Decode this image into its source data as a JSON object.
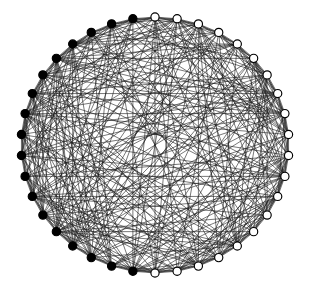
{
  "figure": {
    "background_color": "#ffffff"
  },
  "chart_data": {
    "type": "diagram",
    "subtype": "circular-graph-layout",
    "xlabel": "",
    "ylabel": "",
    "grid": false,
    "legend": "none",
    "layout": {
      "center_x": 155,
      "center_y": 145,
      "radius_x": 134,
      "radius_y": 128,
      "node_count": 38,
      "node_radius": 4.1,
      "start_angle_deg": -90,
      "direction": "clockwise"
    },
    "style": {
      "edge_color": "#1a1a1a",
      "edge_width": 0.75,
      "edge_opacity": 0.78,
      "node_fill_filled": "#000000",
      "node_fill_hollow": "#ffffff",
      "node_stroke": "#000000",
      "node_stroke_width": 1.15
    },
    "node_groups": [
      {
        "name": "filled",
        "label": "Filled (black) vertices",
        "color": "#000000",
        "count": 18
      },
      {
        "name": "hollow",
        "label": "Hollow (white) vertices",
        "color": "#ffffff",
        "count": 20
      }
    ],
    "nodes": [
      {
        "id": 0,
        "angle_deg": -90,
        "group": "hollow"
      },
      {
        "id": 1,
        "angle_deg": -80.5,
        "group": "hollow"
      },
      {
        "id": 2,
        "angle_deg": -71.1,
        "group": "hollow"
      },
      {
        "id": 3,
        "angle_deg": -61.6,
        "group": "hollow"
      },
      {
        "id": 4,
        "angle_deg": -52.1,
        "group": "hollow"
      },
      {
        "id": 5,
        "angle_deg": -42.6,
        "group": "hollow"
      },
      {
        "id": 6,
        "angle_deg": -33.2,
        "group": "hollow"
      },
      {
        "id": 7,
        "angle_deg": -23.7,
        "group": "hollow"
      },
      {
        "id": 8,
        "angle_deg": -14.2,
        "group": "hollow"
      },
      {
        "id": 9,
        "angle_deg": -4.7,
        "group": "hollow"
      },
      {
        "id": 10,
        "angle_deg": 4.7,
        "group": "hollow"
      },
      {
        "id": 11,
        "angle_deg": 14.2,
        "group": "hollow"
      },
      {
        "id": 12,
        "angle_deg": 23.7,
        "group": "hollow"
      },
      {
        "id": 13,
        "angle_deg": 33.2,
        "group": "hollow"
      },
      {
        "id": 14,
        "angle_deg": 42.6,
        "group": "hollow"
      },
      {
        "id": 15,
        "angle_deg": 52.1,
        "group": "hollow"
      },
      {
        "id": 16,
        "angle_deg": 61.6,
        "group": "hollow"
      },
      {
        "id": 17,
        "angle_deg": 71.1,
        "group": "hollow"
      },
      {
        "id": 18,
        "angle_deg": 80.5,
        "group": "hollow"
      },
      {
        "id": 19,
        "angle_deg": 90,
        "group": "hollow"
      },
      {
        "id": 20,
        "angle_deg": 99.5,
        "group": "filled"
      },
      {
        "id": 21,
        "angle_deg": 108.9,
        "group": "filled"
      },
      {
        "id": 22,
        "angle_deg": 118.4,
        "group": "filled"
      },
      {
        "id": 23,
        "angle_deg": 127.9,
        "group": "filled"
      },
      {
        "id": 24,
        "angle_deg": 137.4,
        "group": "filled"
      },
      {
        "id": 25,
        "angle_deg": 146.8,
        "group": "filled"
      },
      {
        "id": 26,
        "angle_deg": 156.3,
        "group": "filled"
      },
      {
        "id": 27,
        "angle_deg": 165.8,
        "group": "filled"
      },
      {
        "id": 28,
        "angle_deg": 175.3,
        "group": "filled"
      },
      {
        "id": 29,
        "angle_deg": 184.7,
        "group": "filled"
      },
      {
        "id": 30,
        "angle_deg": 194.2,
        "group": "filled"
      },
      {
        "id": 31,
        "angle_deg": 203.7,
        "group": "filled"
      },
      {
        "id": 32,
        "angle_deg": 213.2,
        "group": "filled"
      },
      {
        "id": 33,
        "angle_deg": 222.6,
        "group": "filled"
      },
      {
        "id": 34,
        "angle_deg": 232.1,
        "group": "filled"
      },
      {
        "id": 35,
        "angle_deg": 241.6,
        "group": "filled"
      },
      {
        "id": 36,
        "angle_deg": 251.1,
        "group": "filled"
      },
      {
        "id": 37,
        "angle_deg": 260.5,
        "group": "filled"
      }
    ],
    "edge_count": 372,
    "edge_generation": {
      "method": "deterministic-pseudorandom-chords",
      "note": "Every vertex is joined to roughly 19 other vertices by straight chords, producing the dense woven interior."
    }
  }
}
